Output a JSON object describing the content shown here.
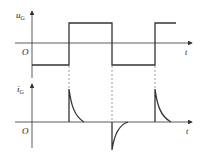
{
  "diagram": {
    "top_plot": {
      "y_label": "u",
      "y_label_sub": "G",
      "origin_label": "O",
      "x_label": "t",
      "signal": "square wave",
      "levels": [
        "low",
        "high"
      ],
      "transitions": [
        "rise",
        "fall",
        "rise"
      ]
    },
    "bottom_plot": {
      "y_label": "i",
      "y_label_sub": "G",
      "origin_label": "O",
      "x_label": "t",
      "signal": "exponentially decaying current spikes",
      "spikes": [
        "positive",
        "negative",
        "positive"
      ]
    },
    "colors": {
      "line": "#333333",
      "dashed": "#777777",
      "background": "#ffffff"
    }
  }
}
